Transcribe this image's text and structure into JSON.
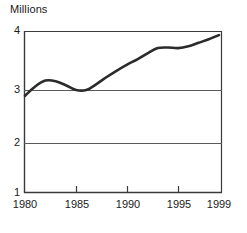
{
  "chart_data": {
    "type": "line",
    "title": "Millions",
    "xlabel": "",
    "ylabel": "Millions",
    "xlim": [
      1980,
      1999
    ],
    "ylim": [
      1,
      4
    ],
    "grid": true,
    "gridlines_y": [
      2,
      3
    ],
    "legend": "none",
    "x_tick_labels": [
      "1980",
      "1985",
      "1990",
      "1995",
      "1999"
    ],
    "x_ticks": [
      1980,
      1985,
      1990,
      1995,
      1999
    ],
    "y_tick_labels": [
      "1",
      "2",
      "3",
      "4"
    ],
    "y_ticks": [
      1,
      2,
      3,
      4
    ],
    "series": [
      {
        "name": "Millions",
        "color": "#2b2b2b",
        "x": [
          1980,
          1981,
          1982,
          1983,
          1984,
          1985,
          1986,
          1987,
          1988,
          1989,
          1990,
          1991,
          1992,
          1993,
          1994,
          1995,
          1996,
          1997,
          1998,
          1999
        ],
        "values": [
          2.89,
          3.06,
          3.16,
          3.15,
          3.08,
          3.0,
          3.0,
          3.1,
          3.22,
          3.33,
          3.43,
          3.52,
          3.62,
          3.71,
          3.72,
          3.71,
          3.74,
          3.8,
          3.86,
          3.93
        ]
      }
    ]
  },
  "axes": {
    "frame_color": "#3a3a3a",
    "gridline_color": "#5a5a5a",
    "background": "#ffffff"
  }
}
